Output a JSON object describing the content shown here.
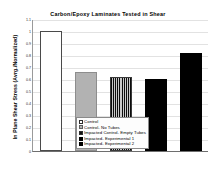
{
  "chart_data": {
    "type": "bar",
    "title": "Carbon/Epoxy Laminates Tested in Shear",
    "xlabel": "",
    "ylabel": "In Plane Shear Stress (Avrg./Normalized)",
    "ylim": [
      0,
      1.1
    ],
    "grid": true,
    "legend_position": "bottom-center",
    "ytick_labels": [
      "0",
      "0.1",
      "0.2",
      "0.3",
      "0.4",
      "0.5",
      "0.6",
      "0.7",
      "0.8",
      "0.9",
      "1",
      "1.1"
    ],
    "ytick_values": [
      0,
      0.1,
      0.2,
      0.3,
      0.4,
      0.5,
      0.6,
      0.7,
      0.8,
      0.9,
      1.0,
      1.1
    ],
    "categories": [
      "Control",
      "Control- No Tubes",
      "Impacted Control- Empty Tubes",
      "Impacted- Experimental 1",
      "Impacted- Experimental 2"
    ],
    "values": [
      1.0,
      0.66,
      0.62,
      0.6,
      0.82
    ],
    "bar_styles": [
      "white",
      "gray",
      "stripe",
      "black",
      "black"
    ]
  },
  "legend": {
    "entries": [
      {
        "label": "Control",
        "swatch": "white"
      },
      {
        "label": "Control- No Tubes",
        "swatch": "gray"
      },
      {
        "label": "Impacted Control- Empty Tubes",
        "swatch": "stripe"
      },
      {
        "label": "Impacted- Experimental 1",
        "swatch": "black"
      },
      {
        "label": "Impacted- Experimental 2",
        "swatch": "black"
      }
    ]
  }
}
